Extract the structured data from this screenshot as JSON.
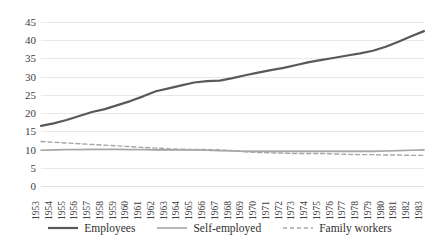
{
  "chart_data": {
    "type": "line",
    "title": "",
    "xlabel": "",
    "ylabel": "",
    "ylim": [
      0,
      45
    ],
    "yticks": [
      0,
      5,
      10,
      15,
      20,
      25,
      30,
      35,
      40,
      45
    ],
    "grid": true,
    "legend_position": "bottom",
    "x": [
      "1953",
      "1954",
      "1955",
      "1956",
      "1957",
      "1958",
      "1959",
      "1960",
      "1961",
      "1962",
      "1963",
      "1964",
      "1965",
      "1966",
      "1967",
      "1968",
      "1969",
      "1970",
      "1971",
      "1972",
      "1973",
      "1974",
      "1975",
      "1976",
      "1977",
      "1978",
      "1979",
      "1980",
      "1981",
      "1982",
      "1983"
    ],
    "series": [
      {
        "name": "Employees",
        "color": "#595959",
        "style": "solid",
        "width": 2.2,
        "values": [
          16.5,
          17.2,
          18.1,
          19.2,
          20.3,
          21.1,
          22.2,
          23.3,
          24.6,
          26.0,
          26.8,
          27.6,
          28.4,
          28.8,
          28.9,
          29.6,
          30.4,
          31.1,
          31.8,
          32.4,
          33.2,
          34.0,
          34.6,
          35.2,
          35.8,
          36.4,
          37.1,
          38.2,
          39.6,
          41.1,
          42.5
        ]
      },
      {
        "name": "Self-employed",
        "color": "#a6a6a6",
        "style": "solid",
        "width": 1.6,
        "values": [
          9.8,
          9.9,
          10.0,
          10.0,
          10.1,
          10.1,
          10.1,
          10.0,
          10.0,
          9.9,
          9.9,
          9.9,
          9.9,
          9.8,
          9.7,
          9.6,
          9.5,
          9.5,
          9.5,
          9.5,
          9.5,
          9.5,
          9.5,
          9.5,
          9.5,
          9.5,
          9.5,
          9.6,
          9.7,
          9.8,
          9.9
        ]
      },
      {
        "name": "Family workers",
        "color": "#a6a6a6",
        "style": "dashed",
        "width": 1.4,
        "values": [
          12.2,
          12.0,
          11.8,
          11.6,
          11.4,
          11.2,
          11.0,
          10.8,
          10.6,
          10.4,
          10.2,
          10.1,
          10.0,
          10.0,
          9.9,
          9.7,
          9.4,
          9.2,
          9.1,
          9.0,
          8.9,
          8.9,
          8.9,
          8.8,
          8.7,
          8.6,
          8.6,
          8.5,
          8.5,
          8.4,
          8.4
        ]
      }
    ]
  },
  "legend": {
    "items": [
      {
        "label": "Employees"
      },
      {
        "label": "Self-employed"
      },
      {
        "label": "Family workers"
      }
    ]
  }
}
